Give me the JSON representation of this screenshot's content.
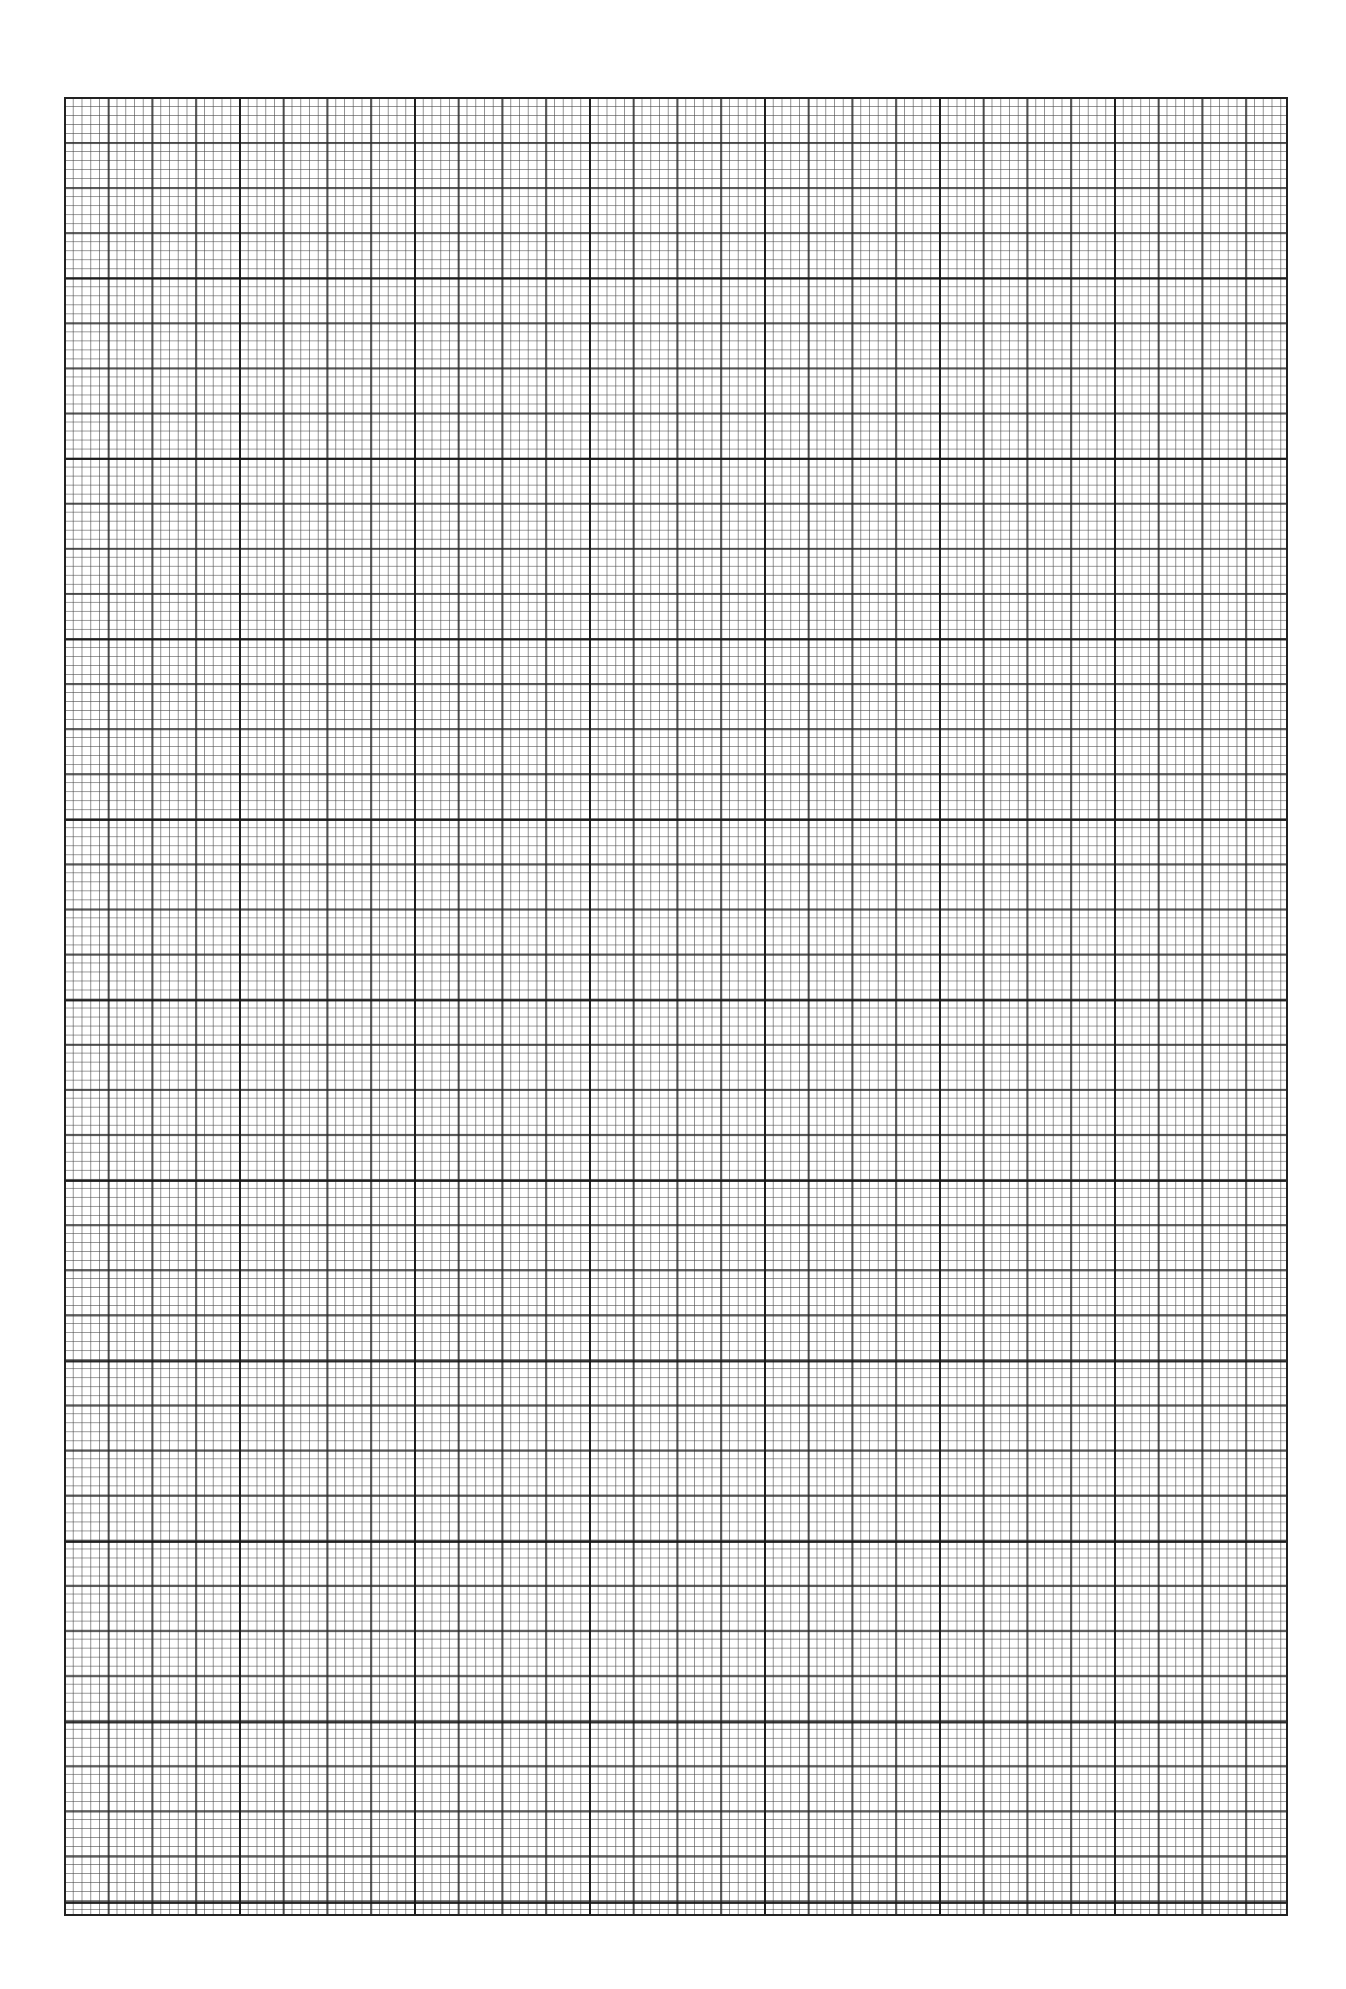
{
  "page": {
    "type": "graph-paper",
    "colors": {
      "background": "#ffffff",
      "lines": "#222222"
    },
    "grid": {
      "major_columns": 7,
      "major_rows": 10,
      "medium_per_major": 4,
      "minor_per_medium": 5
    }
  }
}
